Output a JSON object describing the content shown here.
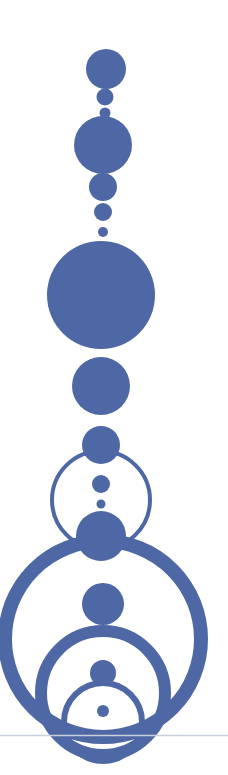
{
  "artwork": {
    "title": "Abstract Circle Totem",
    "description": "Vertical stack of filled discs and concentric open rings in slate blue on white",
    "canvas": {
      "width": 228,
      "height": 775,
      "background": "#ffffff"
    },
    "palette": {
      "primary": "#4e67a5",
      "baseline": "#c9cfdd",
      "background": "#ffffff"
    },
    "axis_x": 102,
    "baseline": {
      "y": 735.5,
      "x1": 0,
      "x2": 228,
      "thickness": 1.6,
      "color": "#c9cfdd"
    },
    "discs": [
      {
        "name": "disc-01-top",
        "cx": 106,
        "cy": 69,
        "r": 20
      },
      {
        "name": "disc-02",
        "cx": 105,
        "cy": 97,
        "r": 8.5
      },
      {
        "name": "disc-03",
        "cx": 105,
        "cy": 113,
        "r": 5.5
      },
      {
        "name": "disc-04-large",
        "cx": 103,
        "cy": 145,
        "r": 29
      },
      {
        "name": "disc-05",
        "cx": 103,
        "cy": 187,
        "r": 14
      },
      {
        "name": "disc-06",
        "cx": 103,
        "cy": 212,
        "r": 9
      },
      {
        "name": "disc-07-small",
        "cx": 103,
        "cy": 232,
        "r": 5
      },
      {
        "name": "disc-08-largest",
        "cx": 101,
        "cy": 295,
        "r": 54
      },
      {
        "name": "disc-09",
        "cx": 101,
        "cy": 386,
        "r": 29
      },
      {
        "name": "disc-10",
        "cx": 101,
        "cy": 445,
        "r": 19
      },
      {
        "name": "disc-11",
        "cx": 101,
        "cy": 484,
        "r": 9
      },
      {
        "name": "disc-12-tiny",
        "cx": 101,
        "cy": 504,
        "r": 4.5
      },
      {
        "name": "disc-13",
        "cx": 101,
        "cy": 536,
        "r": 25
      },
      {
        "name": "disc-14-ring1-center",
        "cx": 103,
        "cy": 604,
        "r": 21
      },
      {
        "name": "disc-15-ring2-center",
        "cx": 103,
        "cy": 673,
        "r": 13
      },
      {
        "name": "disc-16-ring3-center",
        "cx": 103,
        "cy": 711,
        "r": 6
      }
    ],
    "rings": [
      {
        "name": "ring-upper",
        "cx": 101,
        "cy": 500,
        "r": 49,
        "stroke": 4
      },
      {
        "name": "ring-outer-large",
        "cx": 103,
        "cy": 639,
        "r": 98,
        "stroke": 14
      },
      {
        "name": "ring-middle",
        "cx": 103,
        "cy": 693,
        "r": 62,
        "stroke": 12
      },
      {
        "name": "ring-inner",
        "cx": 103,
        "cy": 722,
        "r": 39,
        "stroke": 6
      }
    ]
  }
}
